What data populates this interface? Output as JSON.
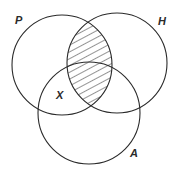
{
  "diagram": {
    "type": "venn",
    "sets": [
      {
        "id": "P",
        "label": "P"
      },
      {
        "id": "H",
        "label": "H"
      },
      {
        "id": "A",
        "label": "A"
      }
    ],
    "region_label": "X",
    "shaded_region": "P ∩ H",
    "stroke_color": "#2a2a2a",
    "background": "#ffffff"
  }
}
